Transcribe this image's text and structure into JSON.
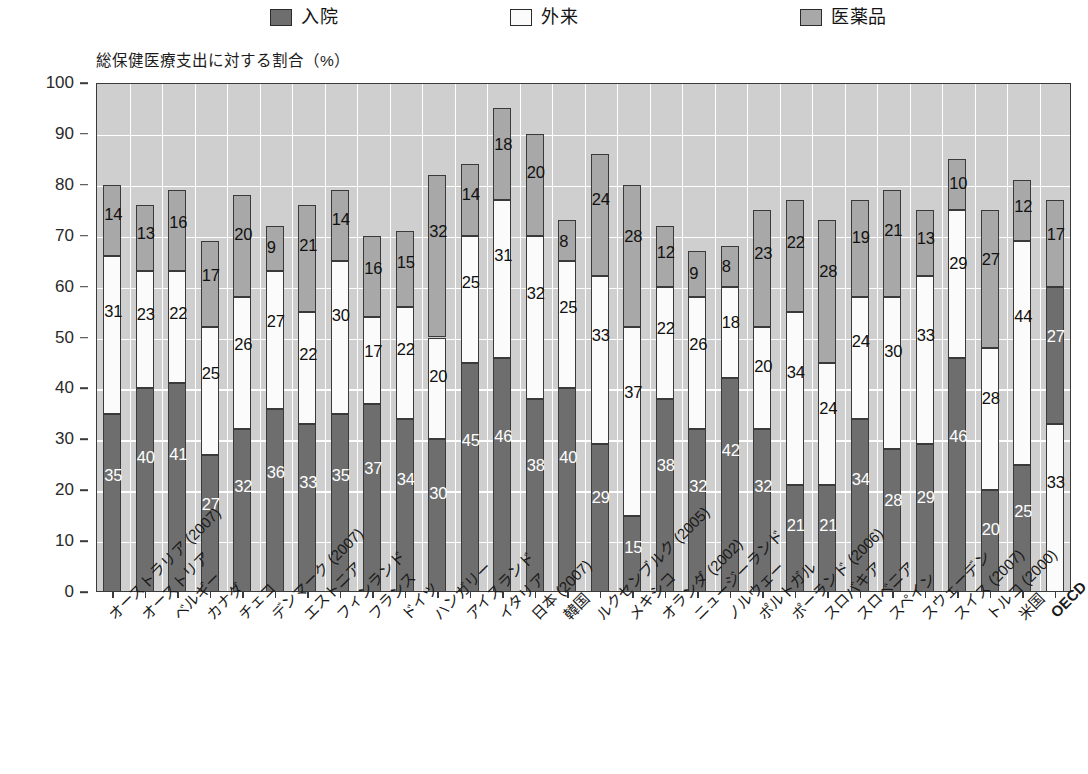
{
  "legend": {
    "items": [
      {
        "label": "入院",
        "color": "#6e6e6e",
        "icon": "square-swatch-dark"
      },
      {
        "label": "外来",
        "color": "#fbfbfb",
        "icon": "square-swatch-white"
      },
      {
        "label": "医薬品",
        "color": "#a8a8a8",
        "icon": "square-swatch-gray"
      }
    ]
  },
  "axis_title": "総保健医療支出に対する割合（%）",
  "chart_data": {
    "type": "bar",
    "subtype": "stacked-vertical",
    "title": "",
    "subtitle": "",
    "xlabel": "",
    "ylabel": "総保健医療支出に対する割合（%）",
    "ylim": [
      0,
      100
    ],
    "yticks": [
      0,
      10,
      20,
      30,
      40,
      50,
      60,
      70,
      80,
      90,
      100
    ],
    "grid": true,
    "legend_position": "top",
    "categories": [
      "オーストラリア (2007)",
      "オーストリア",
      "ベルギー",
      "カナダ",
      "チェコ",
      "デンマーク (2007)",
      "エストニア",
      "フィンランド",
      "フランス",
      "ドイツ",
      "ハンガリー",
      "アイスランド",
      "イタリア",
      "日本 (2007)",
      "韓国",
      "ルクセンブルク (2005)",
      "メキシコ",
      "オランダ (2002)",
      "ニュージーランド",
      "ノルウェー",
      "ポルトガル",
      "ポーランド (2006)",
      "スロバキア",
      "スロベニア",
      "スペイン",
      "スウェーデン",
      "スイス (2007)",
      "トルコ (2000)",
      "米国",
      "OECD"
    ],
    "series": [
      {
        "name": "入院",
        "color": "#6e6e6e",
        "values": [
          35,
          40,
          41,
          27,
          32,
          36,
          33,
          35,
          37,
          34,
          30,
          45,
          46,
          38,
          40,
          29,
          15,
          38,
          32,
          42,
          32,
          21,
          21,
          34,
          28,
          29,
          46,
          20,
          25,
          27
        ]
      },
      {
        "name": "外来",
        "color": "#fbfbfb",
        "values": [
          31,
          23,
          22,
          25,
          26,
          27,
          22,
          30,
          17,
          22,
          20,
          25,
          31,
          32,
          25,
          33,
          37,
          22,
          26,
          18,
          20,
          34,
          24,
          24,
          30,
          33,
          29,
          28,
          44,
          33
        ]
      },
      {
        "name": "医薬品",
        "color": "#a8a8a8",
        "values": [
          14,
          13,
          16,
          17,
          20,
          9,
          21,
          14,
          16,
          15,
          32,
          14,
          18,
          20,
          8,
          24,
          28,
          12,
          9,
          8,
          23,
          22,
          28,
          19,
          21,
          13,
          10,
          27,
          12,
          17
        ]
      }
    ],
    "stack_order_override": {
      "OECD": [
        "外来",
        "入院",
        "医薬品"
      ]
    },
    "totals": [
      80,
      76,
      79,
      69,
      78,
      72,
      76,
      79,
      70,
      71,
      82,
      84,
      95,
      90,
      73,
      86,
      80,
      72,
      67,
      68,
      75,
      77,
      73,
      77,
      79,
      75,
      85,
      75,
      81,
      77
    ]
  }
}
